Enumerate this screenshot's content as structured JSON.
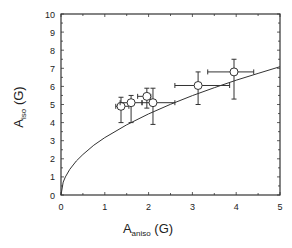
{
  "chart_data": {
    "type": "scatter",
    "title": "",
    "xlabel": "A",
    "xlabel_sub": "aniso",
    "xlabel_unit": "(G)",
    "ylabel": "A",
    "ylabel_sub": "iso",
    "ylabel_unit": "(G)",
    "xlim": [
      0,
      5
    ],
    "ylim": [
      0,
      10
    ],
    "xticks": [
      0,
      1,
      2,
      3,
      4,
      5
    ],
    "yticks": [
      0,
      1,
      2,
      3,
      4,
      5,
      6,
      7,
      8,
      9,
      10
    ],
    "grid": false,
    "legend": null,
    "series": [
      {
        "name": "measured",
        "marker": "open-circle",
        "points": [
          {
            "x": 1.37,
            "y": 4.9,
            "xerr": [
              1.25,
              1.55
            ],
            "yerr": [
              4.0,
              5.4
            ]
          },
          {
            "x": 1.6,
            "y": 5.1,
            "xerr": [
              1.35,
              1.85
            ],
            "yerr": [
              4.0,
              5.5
            ]
          },
          {
            "x": 1.96,
            "y": 5.45,
            "xerr": [
              1.75,
              2.05
            ],
            "yerr": [
              4.8,
              5.9
            ]
          },
          {
            "x": 2.1,
            "y": 5.1,
            "xerr": [
              1.85,
              2.6
            ],
            "yerr": [
              3.9,
              5.9
            ]
          },
          {
            "x": 3.13,
            "y": 6.05,
            "xerr": [
              2.6,
              3.85
            ],
            "yerr": [
              5.0,
              6.8
            ]
          },
          {
            "x": 3.95,
            "y": 6.8,
            "xerr": [
              3.35,
              4.4
            ],
            "yerr": [
              5.3,
              7.5
            ]
          }
        ]
      },
      {
        "name": "fit",
        "type": "line",
        "function": "y = 3.17 * sqrt(x)",
        "x": [
          0,
          0.05,
          0.1,
          0.2,
          0.35,
          0.5,
          0.75,
          1,
          1.5,
          2,
          2.5,
          3,
          3.5,
          4,
          4.5,
          5
        ],
        "y": [
          0,
          0.71,
          1.0,
          1.42,
          1.88,
          2.24,
          2.75,
          3.17,
          3.88,
          4.48,
          5.01,
          5.49,
          5.93,
          6.34,
          6.72,
          7.09
        ]
      }
    ]
  }
}
